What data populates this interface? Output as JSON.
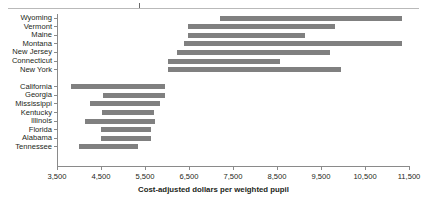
{
  "chart_data": {
    "type": "bar",
    "subtype": "range-bar",
    "orientation": "horizontal",
    "title": "",
    "xlabel": "Cost-adjusted dollars per weighted pupil",
    "ylabel": "",
    "xlim": [
      3500,
      11500
    ],
    "xticks": [
      3500,
      4500,
      5500,
      6500,
      7500,
      8500,
      9500,
      10500,
      11500
    ],
    "xticklabels": [
      "3,500",
      "4,500",
      "5,500",
      "6,500",
      "7,500",
      "8,500",
      "9,500",
      "10,500",
      "11,500"
    ],
    "grid": false,
    "legend": false,
    "bar_color": "#808080",
    "axis_color": "#8a8a8a",
    "groups": [
      {
        "name": "high-spending-states",
        "categories": [
          "Wyoming",
          "Vermont",
          "Maine",
          "Montana",
          "New Jersey",
          "Connecticut",
          "New York"
        ],
        "ranges": [
          {
            "label": "Wyoming",
            "low": 7200,
            "high": 11350
          },
          {
            "label": "Vermont",
            "low": 6480,
            "high": 9820
          },
          {
            "label": "Maine",
            "low": 6480,
            "high": 9140
          },
          {
            "label": "Montana",
            "low": 6390,
            "high": 11350
          },
          {
            "label": "New Jersey",
            "low": 6230,
            "high": 9700
          },
          {
            "label": "Connecticut",
            "low": 6020,
            "high": 8570
          },
          {
            "label": "New York",
            "low": 6020,
            "high": 9950
          }
        ]
      },
      {
        "name": "low-spending-states",
        "categories": [
          "California",
          "Georgia",
          "Mississippi",
          "Kentucky",
          "Illinois",
          "Florida",
          "Alabama",
          "Tennessee"
        ],
        "ranges": [
          {
            "label": "California",
            "low": 3820,
            "high": 5960
          },
          {
            "label": "Georgia",
            "low": 4550,
            "high": 5960
          },
          {
            "label": "Mississippi",
            "low": 4250,
            "high": 5840
          },
          {
            "label": "Kentucky",
            "low": 4520,
            "high": 5700
          },
          {
            "label": "Illinois",
            "low": 4140,
            "high": 5730
          },
          {
            "label": "Florida",
            "low": 4500,
            "high": 5640
          },
          {
            "label": "Alabama",
            "low": 4500,
            "high": 5640
          },
          {
            "label": "Tennessee",
            "low": 4000,
            "high": 5340
          }
        ]
      }
    ]
  }
}
